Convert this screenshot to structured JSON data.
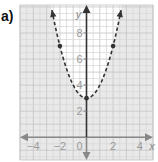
{
  "part_label": "a)",
  "chart_data": {
    "type": "line",
    "title": "",
    "xlabel": "x",
    "ylabel": "y",
    "xlim": [
      -5,
      5
    ],
    "ylim": [
      -1.75,
      10.15
    ],
    "grid": true,
    "grid_minor_step": 0.5,
    "x_ticks": [
      {
        "value": -4,
        "label": "−4"
      },
      {
        "value": -2,
        "label": "−2"
      },
      {
        "value": 0,
        "label": "0"
      },
      {
        "value": 2,
        "label": "2"
      },
      {
        "value": 4,
        "label": "4"
      }
    ],
    "y_ticks": [
      {
        "value": 2,
        "label": "2"
      },
      {
        "value": 4,
        "label": "4"
      },
      {
        "value": 6,
        "label": "6"
      },
      {
        "value": 8,
        "label": "8"
      }
    ],
    "series": [
      {
        "name": "boundary",
        "equation": "y = x^2 + 3",
        "style": "dashed",
        "marked_points": [
          [
            -2,
            7
          ],
          [
            0,
            3
          ],
          [
            2,
            7
          ]
        ],
        "x_range": [
          -2.6,
          2.6
        ]
      }
    ],
    "shading": "outside parabola (y < x^2 + 3)",
    "colors": {
      "shade": "#e9e9e9",
      "grid_minor": "#d9d9d9",
      "grid_major": "#c4c4c4",
      "curve": "#333333",
      "y_axis": "#333333",
      "x_axis": "#888888",
      "tick_label": "#999999"
    }
  }
}
